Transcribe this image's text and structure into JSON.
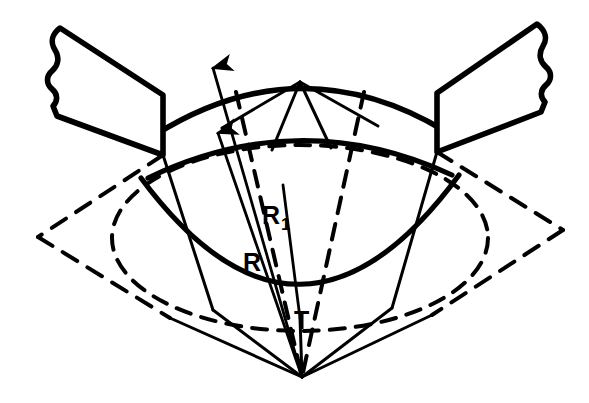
{
  "figure": {
    "background_color": "#ffffff",
    "stroke_color": "#000000",
    "width": 589,
    "height": 403
  },
  "labels": {
    "radius_outer": "R",
    "radius_outer_sub": "1",
    "radius_inner": "R",
    "tangent_point": "T"
  },
  "annotations": [
    {
      "name": "R1",
      "text": "R",
      "subscript": "1",
      "x": 272,
      "y": 215
    },
    {
      "name": "R",
      "text": "R",
      "subscript": "",
      "x": 250,
      "y": 262
    },
    {
      "name": "T",
      "text": "T",
      "subscript": "",
      "x": 301,
      "y": 320
    }
  ],
  "geometry": {
    "apex_bottom": {
      "x": 302,
      "y": 377
    },
    "apex_top": {
      "x": 300,
      "y": 82
    },
    "left_node": {
      "x": 163,
      "y": 155
    },
    "right_node": {
      "x": 437,
      "y": 152
    },
    "diamond_left_vertex": {
      "x": 38,
      "y": 237
    },
    "diamond_right_vertex": {
      "x": 563,
      "y": 230
    },
    "ellipse_center": {
      "x": 300,
      "y": 238
    },
    "ellipse_rx": 188,
    "ellipse_ry": 93,
    "arrow_tip_outer": {
      "x": 213,
      "y": 68
    },
    "arrow_tip_inner": {
      "x": 218,
      "y": 133
    }
  },
  "strokes": {
    "band_width": 5.5,
    "arc_width": 5.0,
    "dashed_width": 4.0,
    "thin_width": 2.6,
    "dash_pattern_ellipse": "15 11",
    "dash_pattern_kite": "17 12"
  }
}
